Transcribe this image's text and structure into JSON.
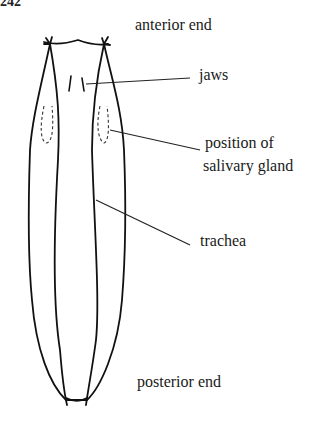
{
  "figure": {
    "number_fragment": "242",
    "labels": {
      "anterior": "anterior end",
      "jaws": "jaws",
      "gland_line1": "position of",
      "gland_line2": "salivary gland",
      "trachea": "trachea",
      "posterior": "posterior end"
    },
    "line_color": "#111111"
  }
}
